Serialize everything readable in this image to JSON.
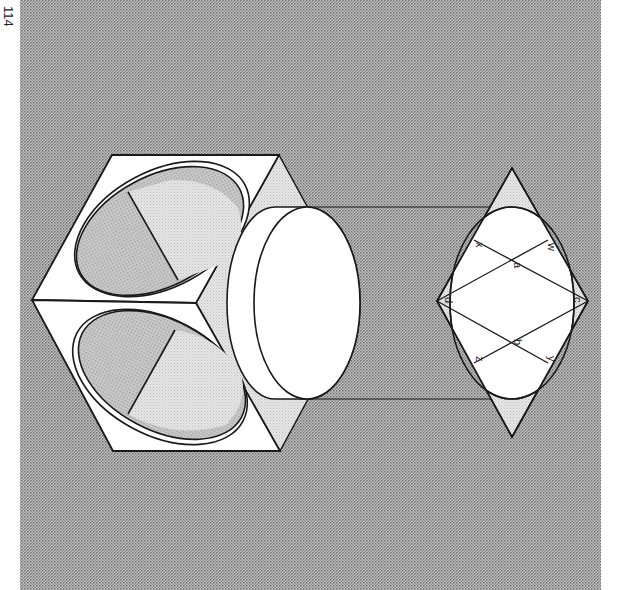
{
  "page": {
    "number": "114"
  },
  "figure": {
    "labels": {
      "a": "a",
      "b": "b",
      "c": "c",
      "d": "d",
      "w": "w",
      "x": "x",
      "y": "y",
      "z": "z"
    },
    "colors": {
      "background_pattern": "#9a9a9a",
      "light_fill": "#dcdcdc",
      "white": "#ffffff",
      "stroke": "#1a1a1a"
    }
  }
}
